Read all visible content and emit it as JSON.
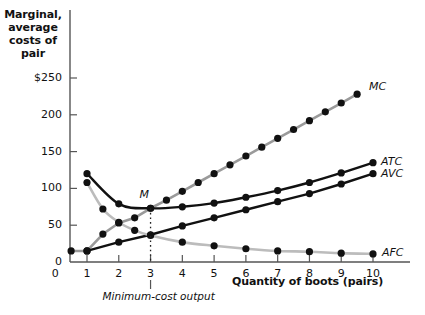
{
  "chart_data": {
    "type": "line",
    "title": "",
    "xlabel": "Quantity of boots (pairs)",
    "ylabel": "Marginal, average costs of pair",
    "xlim": [
      0,
      10.6
    ],
    "ylim": [
      0,
      262
    ],
    "grid": false,
    "legend_position": "right-of-curve-ends",
    "xticks": [
      0,
      1,
      2,
      3,
      4,
      5,
      6,
      7,
      8,
      9,
      10
    ],
    "xtick_labels": [
      "0",
      "1",
      "2",
      "3",
      "4",
      "5",
      "6",
      "7",
      "8",
      "9",
      "10"
    ],
    "yticks": [
      0,
      50,
      100,
      150,
      200,
      250
    ],
    "ytick_labels": [
      "0",
      "50",
      "100",
      "150",
      "200",
      "$250"
    ],
    "series": [
      {
        "name": "MC",
        "label": "MC",
        "color": "#9a9a9a",
        "marker_color": "#111111",
        "x": [
          0.5,
          1,
          1.5,
          2,
          2.5,
          3,
          3.5,
          4,
          4.5,
          5,
          5.5,
          6,
          6.5,
          7,
          7.5,
          8,
          8.5,
          9,
          9.5
        ],
        "y": [
          15,
          15,
          38,
          53,
          60,
          73,
          84,
          96,
          108,
          120,
          132,
          144,
          156,
          168,
          180,
          192,
          204,
          216,
          228
        ]
      },
      {
        "name": "ATC",
        "label": "ATC",
        "color": "#111111",
        "marker_color": "#111111",
        "x": [
          1,
          2,
          3,
          4,
          5,
          6,
          7,
          8,
          9,
          10
        ],
        "y": [
          120,
          79,
          73,
          75,
          80,
          88,
          97,
          108,
          121,
          135
        ]
      },
      {
        "name": "AVC",
        "label": "AVC",
        "color": "#111111",
        "marker_color": "#111111",
        "x": [
          1,
          2,
          3,
          4,
          5,
          6,
          7,
          8,
          9,
          10
        ],
        "y": [
          15,
          27,
          37,
          49,
          60,
          71,
          82,
          93,
          106,
          120
        ]
      },
      {
        "name": "AFC",
        "label": "AFC",
        "color": "#bcbcbc",
        "marker_color": "#111111",
        "x": [
          1,
          1.5,
          2,
          2.5,
          3,
          4,
          5,
          6,
          7,
          8,
          9,
          10
        ],
        "y": [
          108,
          72,
          54,
          43,
          36,
          27,
          22,
          18,
          15,
          14,
          12,
          11
        ]
      }
    ],
    "annotations": [
      {
        "name": "point-m",
        "text": "M",
        "x": 3,
        "y": 73,
        "label_offset_x": 2,
        "label_offset_y": 18
      },
      {
        "name": "minimum-cost-output",
        "text": "Minimum-cost output",
        "x": 3,
        "y": 0,
        "style": "dotted-vertical-line"
      }
    ]
  },
  "axes": {
    "y_title": "Marginal,\naverage\ncosts of\npair",
    "y_title_lines": [
      "Marginal,",
      "average",
      "costs of",
      "pair"
    ],
    "x_title": "Quantity of boots (pairs)"
  },
  "colors": {
    "axis": "#555555",
    "mc_line": "#9a9a9a",
    "afc_line": "#bcbcbc",
    "dark_line": "#111111",
    "marker": "#111111",
    "text": "#111111",
    "background": "#ffffff"
  }
}
